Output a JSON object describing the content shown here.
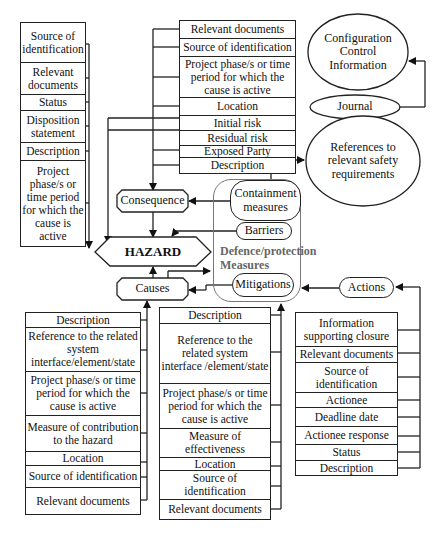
{
  "hazard_tables": {
    "hazard_attributes": {
      "rows": [
        "Source of identification",
        "Relevant documents",
        "Status",
        "Disposition statement",
        "Description",
        "Project phase/s or time period for which the cause is active"
      ]
    },
    "consequence_attributes": {
      "rows": [
        "Relevant documents",
        "Source of identification",
        "Project phase/s or time period for which the cause is active",
        "Location",
        "Initial risk",
        "Residual risk",
        "Exposed Party",
        "Description"
      ]
    },
    "cause_attributes": {
      "rows": [
        "Description",
        "Reference to the related system interface/element/state",
        "Project phase/s or time period for which the cause is active",
        "Measure of contribution to the hazard",
        "Location",
        "Source of identification",
        "Relevant documents"
      ]
    },
    "mitigation_attributes": {
      "rows": [
        "Description",
        "Reference to the related system interface /element/state",
        "Project phase/s or time period for which the cause is active",
        "Measure of effectiveness",
        "Location",
        "Source of identification",
        "Relevant documents"
      ]
    },
    "action_attributes": {
      "rows": [
        "Information supporting closure",
        "Relevant documents",
        "Source of identification",
        "Actionee",
        "Deadline date",
        "Actionee response",
        "Status",
        "Description"
      ]
    }
  },
  "nodes": {
    "hazard": "HAZARD",
    "consequence": "Consequence",
    "causes": "Causes",
    "containment": "Containment measures",
    "barriers": "Barriers",
    "mitigations": "Mitigations",
    "defence_group": "Defence/protection Measures",
    "actions": "Actions",
    "references": "References to relevant safety requirements",
    "config": "Configuration Control Information",
    "journal": "Journal"
  },
  "colors": {
    "line": "#222222",
    "group_border": "#777777",
    "group_label": "#666666"
  }
}
